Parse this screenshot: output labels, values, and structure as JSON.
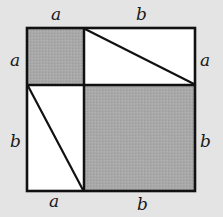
{
  "diagram": {
    "colors": {
      "background": "#e4e4e4",
      "shaded": "#a8a8a8",
      "unshaded": "#ffffff",
      "stroke": "#111111"
    },
    "labels": {
      "top_left": "a",
      "top_right": "b",
      "left_top": "a",
      "left_bottom": "b",
      "right_top": "a",
      "right_bottom": "b",
      "bottom_left": "a",
      "bottom_right": "b"
    },
    "regions": [
      {
        "name": "square-a",
        "shaded": true
      },
      {
        "name": "rectangle-top-right",
        "shaded": false,
        "diagonal": true
      },
      {
        "name": "rectangle-bottom-left",
        "shaded": false,
        "diagonal": true
      },
      {
        "name": "square-b",
        "shaded": true
      }
    ]
  }
}
